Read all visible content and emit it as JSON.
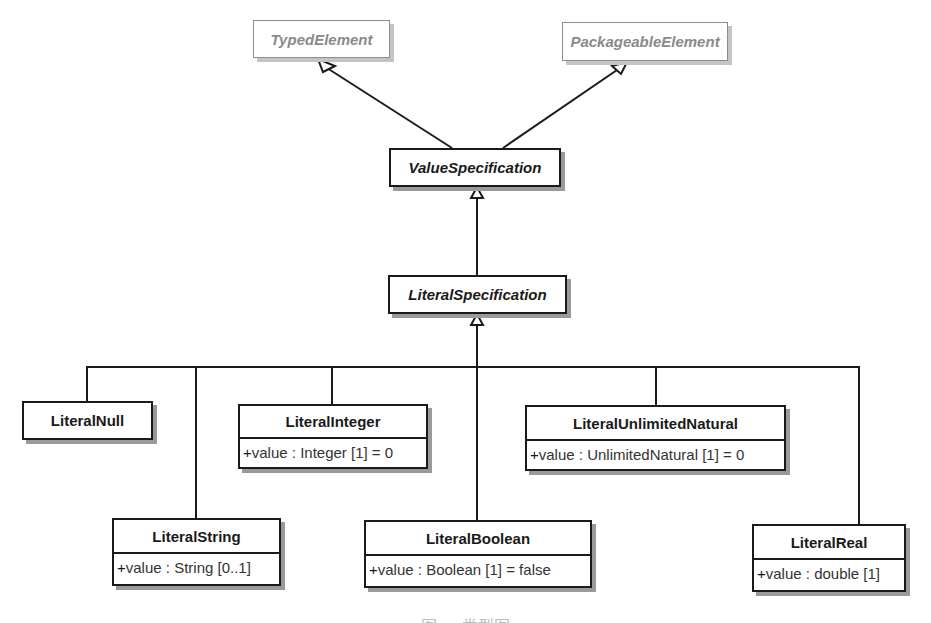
{
  "diagram": {
    "type": "UML class diagram",
    "colors": {
      "line": "#1a1a1a",
      "shadow": "#9a9a9a",
      "ghost_text": "#8a8a8a",
      "ghost_border": "#8c8c8c",
      "background": "#ffffff"
    },
    "classes": {
      "typed_element": {
        "name": "TypedElement",
        "abstract": true,
        "external": true
      },
      "packageable_element": {
        "name": "PackageableElement",
        "abstract": true,
        "external": true
      },
      "value_specification": {
        "name": "ValueSpecification",
        "abstract": true
      },
      "literal_specification": {
        "name": "LiteralSpecification",
        "abstract": true
      },
      "literal_null": {
        "name": "LiteralNull"
      },
      "literal_integer": {
        "name": "LiteralInteger",
        "attribute": {
          "visibility": "+",
          "text": "value : Integer [1] = 0"
        }
      },
      "literal_unlimited_natural": {
        "name": "LiteralUnlimitedNatural",
        "attribute": {
          "visibility": "+",
          "text": "value : UnlimitedNatural [1] = 0"
        }
      },
      "literal_string": {
        "name": "LiteralString",
        "attribute": {
          "visibility": "+",
          "text": "value : String [0..1]"
        }
      },
      "literal_boolean": {
        "name": "LiteralBoolean",
        "attribute": {
          "visibility": "+",
          "text": "value : Boolean [1] = false"
        }
      },
      "literal_real": {
        "name": "LiteralReal",
        "attribute": {
          "visibility": "+",
          "text": "value : double [1]"
        }
      }
    },
    "generalizations": [
      {
        "child": "ValueSpecification",
        "parent": "TypedElement"
      },
      {
        "child": "ValueSpecification",
        "parent": "PackageableElement"
      },
      {
        "child": "LiteralSpecification",
        "parent": "ValueSpecification"
      },
      {
        "child": "LiteralNull",
        "parent": "LiteralSpecification"
      },
      {
        "child": "LiteralString",
        "parent": "LiteralSpecification"
      },
      {
        "child": "LiteralInteger",
        "parent": "LiteralSpecification"
      },
      {
        "child": "LiteralBoolean",
        "parent": "LiteralSpecification"
      },
      {
        "child": "LiteralUnlimitedNatural",
        "parent": "LiteralSpecification"
      },
      {
        "child": "LiteralReal",
        "parent": "LiteralSpecification"
      }
    ],
    "caption": "图 … 类型图"
  }
}
